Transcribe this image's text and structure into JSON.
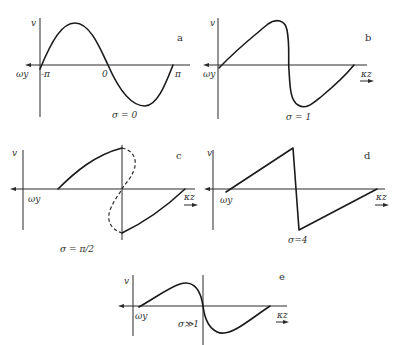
{
  "figure": {
    "panels": [
      {
        "id": "a",
        "tag": "a",
        "y_label": "v",
        "x_left_label": "ωy",
        "tick_labels": [
          "-π",
          "0",
          "π"
        ],
        "caption": "σ = 0",
        "curve_type": "sinusoid"
      },
      {
        "id": "b",
        "tag": "b",
        "y_label": "v",
        "x_left_label": "ωy",
        "x_right_label": "κz",
        "caption": "σ = 1",
        "curve_type": "steepened wave"
      },
      {
        "id": "c",
        "tag": "c",
        "y_label": "v",
        "x_left_label": "ωy",
        "x_right_label": "κz",
        "caption": "σ = π/2",
        "curve_type": "overturned wave with dashed multivalued segment"
      },
      {
        "id": "d",
        "tag": "d",
        "y_label": "v",
        "x_left_label": "ωy",
        "x_right_label": "κz",
        "caption": "σ=4",
        "curve_type": "sawtooth"
      },
      {
        "id": "e",
        "tag": "e",
        "y_label": "v",
        "x_left_label": "ωy",
        "x_right_label": "κz",
        "caption": "σ≫1",
        "curve_type": "decayed sawtooth"
      }
    ]
  }
}
